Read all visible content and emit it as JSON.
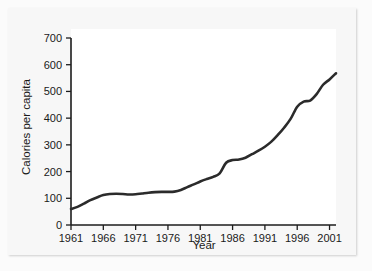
{
  "chart_data": {
    "type": "line",
    "title": "",
    "xlabel": "Year",
    "ylabel": "Calories per capita",
    "xlim": [
      1961,
      2002
    ],
    "ylim": [
      0,
      700
    ],
    "xticks": [
      1961,
      1966,
      1971,
      1976,
      1981,
      1986,
      1991,
      1996,
      2001
    ],
    "yticks": [
      0,
      100,
      200,
      300,
      400,
      500,
      600,
      700
    ],
    "grid": false,
    "legend": null,
    "line_color": "#2b2b2b",
    "series": [
      {
        "name": "Calories per capita",
        "x": [
          1961,
          1962,
          1963,
          1964,
          1965,
          1966,
          1967,
          1968,
          1969,
          1970,
          1971,
          1972,
          1973,
          1974,
          1975,
          1976,
          1977,
          1978,
          1979,
          1980,
          1981,
          1982,
          1983,
          1984,
          1985,
          1986,
          1987,
          1988,
          1989,
          1990,
          1991,
          1992,
          1993,
          1994,
          1995,
          1996,
          1997,
          1998,
          1999,
          2000,
          2001,
          2002
        ],
        "values": [
          60,
          68,
          80,
          93,
          103,
          112,
          116,
          117,
          116,
          114,
          115,
          118,
          121,
          123,
          124,
          124,
          125,
          131,
          142,
          152,
          163,
          172,
          180,
          193,
          233,
          243,
          245,
          252,
          265,
          278,
          293,
          312,
          337,
          365,
          398,
          443,
          462,
          466,
          490,
          525,
          545,
          568
        ]
      }
    ]
  },
  "axis": {
    "x_tick_labels": [
      "1961",
      "1966",
      "1971",
      "1976",
      "1981",
      "1986",
      "1991",
      "1996",
      "2001"
    ],
    "y_tick_labels": [
      "0",
      "100",
      "200",
      "300",
      "400",
      "500",
      "600",
      "700"
    ],
    "x_title": "Year",
    "y_title": "Calories per capita"
  }
}
